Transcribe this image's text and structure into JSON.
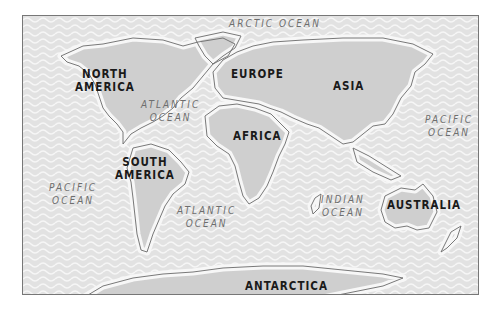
{
  "map": {
    "title": "World Map",
    "colors": {
      "ocean": "#e4e4e4",
      "ocean_wave": "#f4f4f4",
      "land": "#cfcfcf",
      "coast_glow": "#f7f7f7",
      "land_stroke": "#6a6a6a",
      "frame": "#777777"
    },
    "continents": {
      "north_america": "NORTH\nAMERICA",
      "south_america": "SOUTH\nAMERICA",
      "europe": "EUROPE",
      "asia": "ASIA",
      "africa": "AFRICA",
      "australia": "AUSTRALIA",
      "antarctica": "ANTARCTICA"
    },
    "oceans": {
      "arctic": "ARCTIC OCEAN",
      "atlantic_north": "ATLANTIC\nOCEAN",
      "atlantic_south": "ATLANTIC\nOCEAN",
      "pacific_west": "PACIFIC\nOCEAN",
      "pacific_east": "PACIFIC\nOCEAN",
      "indian": "INDIAN\nOCEAN"
    }
  }
}
